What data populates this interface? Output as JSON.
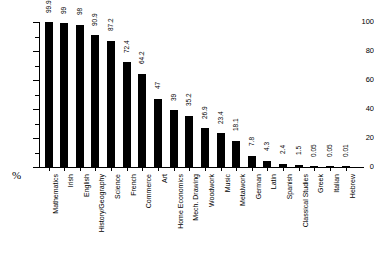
{
  "chart_data": {
    "type": "bar",
    "title": "",
    "subtitle": "",
    "xlabel": "",
    "ylabel": "%",
    "ylim": [
      0,
      100
    ],
    "yticks": [
      0,
      20,
      40,
      60,
      80,
      100
    ],
    "ytick_labels": [
      "0",
      "20",
      "40",
      "60",
      "80",
      "100"
    ],
    "minor_yticks": [
      10,
      30,
      50,
      70,
      90
    ],
    "grid": false,
    "legend": false,
    "bar_color": "#000000",
    "categories": [
      "Mathematics",
      "Irish",
      "English",
      "History/Geography",
      "Science",
      "French",
      "Commerce",
      "Art",
      "Home Economics",
      "Mech. Drawing",
      "Woodwork",
      "Music",
      "Metalwork",
      "German",
      "Latin",
      "Spanish",
      "Classical Studies",
      "Greek",
      "Italian",
      "Hebrew"
    ],
    "values": [
      99.9,
      99,
      98,
      90.9,
      87.2,
      72.4,
      64.2,
      47,
      39,
      35.2,
      26.9,
      23.4,
      18.1,
      7.8,
      4.3,
      2.4,
      1.5,
      0.05,
      0.05,
      0.01
    ],
    "value_labels": [
      "99.9",
      "99",
      "98",
      "90.9",
      "87.2",
      "72.4",
      "64.2",
      "47",
      "39",
      "35.2",
      "26.9",
      "23.4",
      "18.1",
      "7.8",
      "4.3",
      "2.4",
      "1.5",
      "0.05",
      "0.05",
      "0.01"
    ]
  }
}
